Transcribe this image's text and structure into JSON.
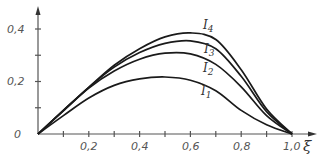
{
  "chart_data": {
    "type": "line",
    "title": "",
    "xlabel": "ξ",
    "ylabel": "",
    "xlim": [
      0,
      1.05
    ],
    "ylim": [
      0,
      0.45
    ],
    "grid": false,
    "legend": "inline labels",
    "x_ticks": [
      "0,2",
      "0,4",
      "0,6",
      "0,8",
      "1,0"
    ],
    "y_ticks": [
      "0,2",
      "0,4"
    ],
    "origin_label": "0",
    "x": [
      0,
      0.1,
      0.2,
      0.3,
      0.4,
      0.5,
      0.6,
      0.7,
      0.8,
      0.9,
      1.0
    ],
    "series": [
      {
        "name": "I1",
        "label_main": "I",
        "label_sub": "1",
        "values": [
          0,
          0.07,
          0.137,
          0.185,
          0.21,
          0.217,
          0.205,
          0.165,
          0.09,
          0.035,
          0
        ]
      },
      {
        "name": "I2",
        "label_main": "I",
        "label_sub": "2",
        "values": [
          0,
          0.088,
          0.175,
          0.24,
          0.285,
          0.308,
          0.305,
          0.265,
          0.18,
          0.07,
          0
        ]
      },
      {
        "name": "I3",
        "label_main": "I",
        "label_sub": "3",
        "values": [
          0,
          0.09,
          0.178,
          0.255,
          0.31,
          0.345,
          0.355,
          0.325,
          0.22,
          0.085,
          0
        ]
      },
      {
        "name": "I4",
        "label_main": "I",
        "label_sub": "4",
        "values": [
          0,
          0.09,
          0.178,
          0.262,
          0.325,
          0.37,
          0.385,
          0.36,
          0.245,
          0.095,
          0
        ]
      }
    ]
  },
  "axes": {
    "x_title": "ξ",
    "origin": "0",
    "x_tick_labels": [
      "0,2",
      "0,4",
      "0,6",
      "0,8",
      "1,0"
    ],
    "y_tick_labels": [
      "0,2",
      "0,4"
    ]
  },
  "labels": {
    "I1": {
      "main": "I",
      "sub": "1"
    },
    "I2": {
      "main": "I",
      "sub": "2"
    },
    "I3": {
      "main": "I",
      "sub": "3"
    },
    "I4": {
      "main": "I",
      "sub": "4"
    }
  }
}
